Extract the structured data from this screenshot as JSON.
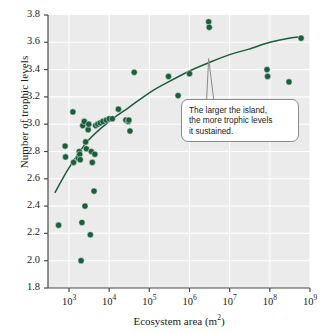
{
  "chart_data": {
    "type": "scatter",
    "title": "",
    "xlabel": "Ecosystem area (m2)",
    "ylabel": "Number of trophic levels",
    "xscale": "log",
    "xlim": [
      300,
      1000000000
    ],
    "ylim": [
      1.8,
      3.8
    ],
    "grid": true,
    "legend": null,
    "xticks": [
      {
        "value": 1000,
        "label_base": "10",
        "label_exp": "3"
      },
      {
        "value": 10000,
        "label_base": "10",
        "label_exp": "4"
      },
      {
        "value": 100000,
        "label_base": "10",
        "label_exp": "5"
      },
      {
        "value": 1000000,
        "label_base": "10",
        "label_exp": "6"
      },
      {
        "value": 10000000,
        "label_base": "10",
        "label_exp": "7"
      },
      {
        "value": 100000000,
        "label_base": "10",
        "label_exp": "8"
      },
      {
        "value": 1000000000,
        "label_base": "10",
        "label_exp": "9"
      }
    ],
    "yticks": [
      {
        "value": 1.8,
        "label": "1.8"
      },
      {
        "value": 2.0,
        "label": "2.0"
      },
      {
        "value": 2.2,
        "label": "2.2"
      },
      {
        "value": 2.4,
        "label": "2.4"
      },
      {
        "value": 2.6,
        "label": "2.6"
      },
      {
        "value": 2.8,
        "label": "2.8"
      },
      {
        "value": 3.0,
        "label": "3.0"
      },
      {
        "value": 3.2,
        "label": "3.2"
      },
      {
        "value": 3.4,
        "label": "3.4"
      },
      {
        "value": 3.6,
        "label": "3.6"
      },
      {
        "value": 3.8,
        "label": "3.8"
      }
    ],
    "points": [
      {
        "x": 550,
        "y": 2.26
      },
      {
        "x": 800,
        "y": 2.84
      },
      {
        "x": 820,
        "y": 2.76
      },
      {
        "x": 1250,
        "y": 3.09
      },
      {
        "x": 1300,
        "y": 2.72
      },
      {
        "x": 1700,
        "y": 2.75
      },
      {
        "x": 1800,
        "y": 2.8
      },
      {
        "x": 1850,
        "y": 2.78
      },
      {
        "x": 1900,
        "y": 2.74
      },
      {
        "x": 2000,
        "y": 2.0
      },
      {
        "x": 2100,
        "y": 2.28
      },
      {
        "x": 2200,
        "y": 2.99
      },
      {
        "x": 2400,
        "y": 3.02
      },
      {
        "x": 2500,
        "y": 2.4
      },
      {
        "x": 2600,
        "y": 2.87
      },
      {
        "x": 2700,
        "y": 2.82
      },
      {
        "x": 3000,
        "y": 2.96
      },
      {
        "x": 3100,
        "y": 3.0
      },
      {
        "x": 3400,
        "y": 2.19
      },
      {
        "x": 3600,
        "y": 2.8
      },
      {
        "x": 3800,
        "y": 2.72
      },
      {
        "x": 4200,
        "y": 2.51
      },
      {
        "x": 4400,
        "y": 2.78
      },
      {
        "x": 4600,
        "y": 2.99
      },
      {
        "x": 5200,
        "y": 3.0
      },
      {
        "x": 6000,
        "y": 3.01
      },
      {
        "x": 7000,
        "y": 3.02
      },
      {
        "x": 8500,
        "y": 3.03
      },
      {
        "x": 10000,
        "y": 3.04
      },
      {
        "x": 12000,
        "y": 3.04
      },
      {
        "x": 17000,
        "y": 3.11
      },
      {
        "x": 26000,
        "y": 3.03
      },
      {
        "x": 30000,
        "y": 3.02
      },
      {
        "x": 31000,
        "y": 3.03
      },
      {
        "x": 33000,
        "y": 2.95
      },
      {
        "x": 42000,
        "y": 3.38
      },
      {
        "x": 300000,
        "y": 3.35
      },
      {
        "x": 520000,
        "y": 3.21
      },
      {
        "x": 1000000,
        "y": 3.37
      },
      {
        "x": 3000000,
        "y": 3.75
      },
      {
        "x": 3100000,
        "y": 3.71
      },
      {
        "x": 85000000,
        "y": 3.4
      },
      {
        "x": 88000000,
        "y": 3.35
      },
      {
        "x": 300000000,
        "y": 3.31
      },
      {
        "x": 600000000,
        "y": 3.63
      }
    ],
    "fit_curve": {
      "description": "logarithmic trend line",
      "points": [
        {
          "x": 450,
          "y": 2.5
        },
        {
          "x": 1000,
          "y": 2.68
        },
        {
          "x": 3000,
          "y": 2.88
        },
        {
          "x": 10000,
          "y": 3.02
        },
        {
          "x": 30000,
          "y": 3.12
        },
        {
          "x": 100000,
          "y": 3.23
        },
        {
          "x": 300000,
          "y": 3.31
        },
        {
          "x": 1000000,
          "y": 3.39
        },
        {
          "x": 3000000,
          "y": 3.45
        },
        {
          "x": 10000000,
          "y": 3.51
        },
        {
          "x": 30000000,
          "y": 3.55
        },
        {
          "x": 100000000,
          "y": 3.6
        },
        {
          "x": 300000000,
          "y": 3.63
        },
        {
          "x": 620000000,
          "y": 3.64
        }
      ]
    },
    "annotations": [
      {
        "name": "island-size-callout",
        "lines": [
          "The larger the island,",
          "the more trophic levels",
          "it sustained."
        ],
        "points_to": {
          "x": 3000000,
          "y": 3.48
        }
      }
    ],
    "colors": {
      "marker": "#1b5e3c",
      "curve": "#1b5e3c",
      "plot_background": "#ebebeb",
      "gridline": "#ffffff",
      "axis": "#4a4a4a",
      "callout_border": "#8a8a8a",
      "callout_background": "#ffffff"
    }
  }
}
